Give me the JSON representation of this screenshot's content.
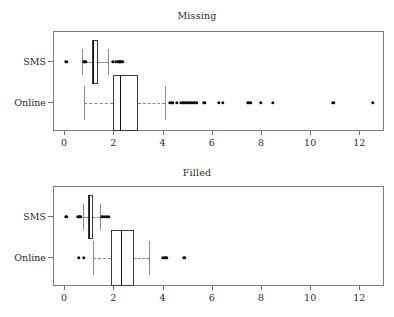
{
  "figure": {
    "width": 394,
    "height": 317,
    "background": "#ffffff",
    "foreground": "#1a1a1a",
    "frame_color": "#7d7d7d",
    "whisker_color": "#8a8a8a",
    "point_color": "#0d0d0d"
  },
  "chart_data": [
    {
      "type": "box",
      "title": "Missing",
      "xlabel": "",
      "ylabel": "",
      "orientation": "horizontal",
      "xlim": [
        -0.45,
        13.0
      ],
      "xticks": [
        0,
        2,
        4,
        6,
        8,
        10,
        12
      ],
      "xticklabels": [
        "0",
        "2",
        "4",
        "6",
        "8",
        "10",
        "12"
      ],
      "categories": [
        "SMS",
        "Online"
      ],
      "grid": false,
      "legend": "none",
      "boxes": [
        {
          "name": "SMS",
          "whisker_low": 0.7,
          "q1": 1.1,
          "median": 1.15,
          "q3": 1.35,
          "whisker_high": 1.75,
          "outliers": [
            0.05,
            0.78,
            0.82,
            1.95,
            2.05,
            2.15,
            2.2,
            2.25,
            2.3,
            2.35
          ]
        },
        {
          "name": "Online",
          "whisker_low": 0.78,
          "q1": 1.95,
          "median": 2.25,
          "q3": 2.95,
          "whisker_high": 4.05,
          "outliers": [
            4.25,
            4.35,
            4.55,
            4.7,
            4.8,
            4.9,
            4.95,
            5.05,
            5.15,
            5.25,
            5.35,
            5.65,
            6.25,
            6.4,
            7.45,
            7.55,
            7.95,
            8.45,
            10.9,
            12.5
          ]
        }
      ]
    },
    {
      "type": "box",
      "title": "Filled",
      "xlabel": "",
      "ylabel": "",
      "orientation": "horizontal",
      "xlim": [
        -0.45,
        13.0
      ],
      "xticks": [
        0,
        2,
        4,
        6,
        8,
        10,
        12
      ],
      "xticklabels": [
        "0",
        "2",
        "4",
        "6",
        "8",
        "10",
        "12"
      ],
      "categories": [
        "SMS",
        "Online"
      ],
      "grid": false,
      "legend": "none",
      "boxes": [
        {
          "name": "SMS",
          "whisker_low": 0.72,
          "q1": 0.95,
          "median": 1.0,
          "q3": 1.15,
          "whisker_high": 1.4,
          "outliers": [
            0.05,
            0.52,
            0.58,
            0.64,
            1.52,
            1.62,
            1.7,
            1.78
          ]
        },
        {
          "name": "Online",
          "whisker_low": 1.15,
          "q1": 1.85,
          "median": 2.3,
          "q3": 2.8,
          "whisker_high": 3.4,
          "outliers": [
            0.55,
            0.75,
            3.98,
            4.05,
            4.12,
            4.85
          ]
        }
      ]
    }
  ]
}
